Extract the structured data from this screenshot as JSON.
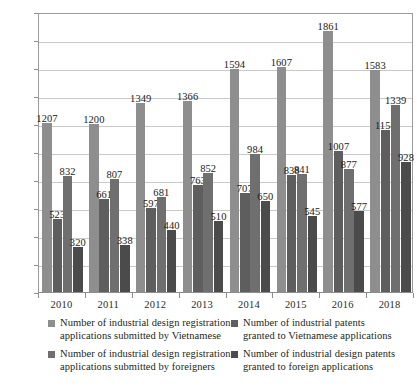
{
  "chart_data": {
    "type": "bar",
    "title": "",
    "subtitle": "",
    "xlabel": "",
    "ylabel": "",
    "ylim": [
      0,
      2000
    ],
    "ytick_step": 200,
    "yticks": [
      0,
      200,
      400,
      600,
      800,
      1000,
      1200,
      1400,
      1600,
      1800,
      2000
    ],
    "grid": true,
    "legend_position": "bottom",
    "categories": [
      "2010",
      "2011",
      "2012",
      "2013",
      "2014",
      "2015",
      "2016",
      "2018"
    ],
    "series": [
      {
        "name": "Number of industrial design registration applications submitted by Vietnamese",
        "color": "#8e8e8e",
        "values": [
          1207,
          1200,
          1349,
          1366,
          1594,
          1607,
          1861,
          1583
        ]
      },
      {
        "name": "Number of industrial patents granted to Vietnamese applications",
        "color": "#5e5e5e",
        "values": [
          523,
          661,
          597,
          763,
          707,
          838,
          1007,
          1158
        ]
      },
      {
        "name": "Number of industrial design registration applications submitted by foreigners",
        "color": "#6f6f6f",
        "values": [
          832,
          807,
          681,
          852,
          984,
          841,
          877,
          1339
        ]
      },
      {
        "name": "Number of industrial design patents granted to foreign applications",
        "color": "#4b4b4b",
        "values": [
          320,
          338,
          440,
          510,
          650,
          545,
          577,
          928
        ]
      }
    ]
  },
  "legend": {
    "items": [
      {
        "line1": "Number of industrial design registration",
        "line2": "applications submitted by Vietnamese",
        "color": "#8e8e8e"
      },
      {
        "line1": "Number of industrial design registration",
        "line2": "applications submitted by foreigners",
        "color": "#6f6f6f"
      },
      {
        "line1": "Number of industrial patents",
        "line2": "granted to Vietnamese applications",
        "color": "#5e5e5e"
      },
      {
        "line1": "Number of industrial design patents",
        "line2": "granted to foreign applications",
        "color": "#4b4b4b"
      }
    ]
  }
}
